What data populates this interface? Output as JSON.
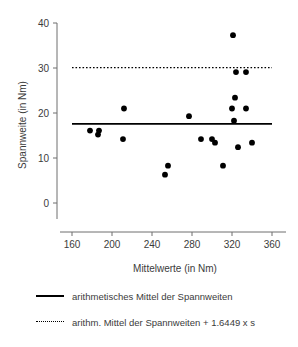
{
  "chart_data": {
    "type": "scatter",
    "title": "",
    "xlabel": "Mittelwerte (in Nm)",
    "ylabel": "Spannweite (in Nm)",
    "xlim": [
      152,
      372
    ],
    "ylim": [
      -2,
      41
    ],
    "xticks": [
      160,
      200,
      240,
      280,
      320,
      360
    ],
    "yticks": [
      0,
      10,
      20,
      30,
      40
    ],
    "grid": false,
    "legend_position": "below",
    "points": [
      {
        "x": 178,
        "y": 16.1
      },
      {
        "x": 186,
        "y": 15.2
      },
      {
        "x": 187,
        "y": 16.1
      },
      {
        "x": 212,
        "y": 21.0
      },
      {
        "x": 211,
        "y": 14.2
      },
      {
        "x": 253,
        "y": 6.3
      },
      {
        "x": 256,
        "y": 8.3
      },
      {
        "x": 277,
        "y": 19.3
      },
      {
        "x": 289,
        "y": 14.2
      },
      {
        "x": 300,
        "y": 14.2
      },
      {
        "x": 303,
        "y": 13.4
      },
      {
        "x": 311,
        "y": 8.3
      },
      {
        "x": 320,
        "y": 21.0
      },
      {
        "x": 321,
        "y": 37.3
      },
      {
        "x": 322,
        "y": 18.3
      },
      {
        "x": 323,
        "y": 23.4
      },
      {
        "x": 324,
        "y": 29.1
      },
      {
        "x": 326,
        "y": 12.4
      },
      {
        "x": 334,
        "y": 29.1
      },
      {
        "x": 334,
        "y": 21.0
      },
      {
        "x": 340,
        "y": 13.4
      }
    ],
    "reference_lines": [
      {
        "name": "arithmetic-mean",
        "style": "solid",
        "value": 17.6
      },
      {
        "name": "mean-plus-1.6449s",
        "style": "dotted",
        "value": 30.1
      }
    ]
  },
  "legend": {
    "items": [
      {
        "style": "solid",
        "label": "arithmetisches Mittel der Spannweiten"
      },
      {
        "style": "dotted",
        "label": "arithm. Mittel der Spannweiten + 1.6449 x s"
      }
    ]
  }
}
